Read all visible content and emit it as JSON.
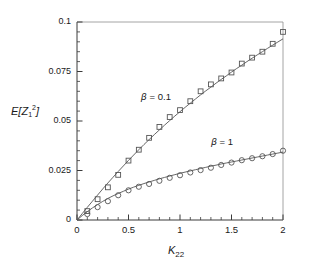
{
  "chart_data": {
    "type": "scatter",
    "title": "",
    "xlabel": "K22",
    "xlabel_base": "K",
    "xlabel_sub": "22",
    "ylabel": "E[Z_1^2]",
    "ylabel_prefix": "E[",
    "ylabel_var": "Z",
    "ylabel_sub": "1",
    "ylabel_sup": "2",
    "ylabel_suffix": "]",
    "xlim": [
      0,
      2
    ],
    "ylim": [
      0,
      0.1
    ],
    "grid": false,
    "legend_position": "inline-annotations",
    "xticks": [
      "0",
      "0.5",
      "1",
      "1.5",
      "2"
    ],
    "xtick_values": [
      0,
      0.5,
      1,
      1.5,
      2
    ],
    "x_minor_step": 0.1,
    "yticks": [
      "0",
      "0.025",
      "0.05",
      "0.075",
      "0.1"
    ],
    "ytick_values": [
      0,
      0.025,
      0.05,
      0.075,
      0.1
    ],
    "y_minor_step": 0.005,
    "annotations": [
      {
        "text_beta": "β",
        "text_rest": " = 0.1",
        "x": 0.62,
        "y": 0.0615
      },
      {
        "text_beta": "β",
        "text_rest": " = 1",
        "x": 1.3,
        "y": 0.039
      }
    ],
    "series": [
      {
        "name": "beta = 0.1",
        "marker": "square",
        "color": "#555555",
        "line_color": "#555555",
        "x": [
          0.05,
          0.1,
          0.15,
          0.2,
          0.25,
          0.3,
          0.35,
          0.4,
          0.45,
          0.5,
          0.55,
          0.6,
          0.65,
          0.7,
          0.75,
          0.8,
          0.85,
          0.9,
          0.95,
          1.0,
          1.05,
          1.1,
          1.15,
          1.2,
          1.25,
          1.3,
          1.35,
          1.4,
          1.45,
          1.5,
          1.55,
          1.6,
          1.65,
          1.7,
          1.75,
          1.8,
          1.85,
          1.9,
          1.95,
          2.0
        ],
        "y": [
          0.0028,
          0.0055,
          0.0082,
          0.0108,
          0.0133,
          0.0158,
          0.0182,
          0.0206,
          0.0229,
          0.0251,
          0.0273,
          0.0294,
          0.0315,
          0.0335,
          0.0355,
          0.0374,
          0.0393,
          0.0411,
          0.0429,
          0.0447,
          0.0464,
          0.0481,
          0.0497,
          0.0513,
          0.0529,
          0.0544,
          0.056,
          0.0575,
          0.0589,
          0.0604,
          0.0618,
          0.0632,
          0.0645,
          0.0659,
          0.0672,
          0.0685,
          0.0698,
          0.0711,
          0.0723,
          0.0735
        ],
        "points_x": [
          0.1,
          0.2,
          0.3,
          0.4,
          0.5,
          0.6,
          0.7,
          0.8,
          0.9,
          1.0,
          1.1,
          1.2,
          1.3,
          1.4,
          1.5,
          1.6,
          1.7,
          1.8,
          1.9,
          2.0
        ],
        "points_y": [
          0.0045,
          0.0105,
          0.0165,
          0.0228,
          0.03,
          0.0355,
          0.0415,
          0.047,
          0.052,
          0.0555,
          0.06,
          0.065,
          0.0685,
          0.0715,
          0.0745,
          0.079,
          0.082,
          0.085,
          0.089,
          0.095
        ],
        "curve_x": [
          0,
          0.05,
          0.1,
          0.15,
          0.2,
          0.25,
          0.3,
          0.35,
          0.4,
          0.45,
          0.5,
          0.55,
          0.6,
          0.65,
          0.7,
          0.75,
          0.8,
          0.85,
          0.9,
          0.95,
          1.0,
          1.05,
          1.1,
          1.15,
          1.2,
          1.25,
          1.3,
          1.35,
          1.4,
          1.45,
          1.5,
          1.55,
          1.6,
          1.65,
          1.7,
          1.75,
          1.8,
          1.85,
          1.9,
          1.95,
          2.0
        ],
        "curve_y": [
          0,
          0.0032,
          0.0064,
          0.0095,
          0.0126,
          0.0157,
          0.0187,
          0.0216,
          0.0245,
          0.0273,
          0.0301,
          0.0328,
          0.0355,
          0.0381,
          0.0406,
          0.0431,
          0.0455,
          0.0479,
          0.0502,
          0.0525,
          0.0547,
          0.0569,
          0.059,
          0.0611,
          0.0632,
          0.0652,
          0.0671,
          0.0691,
          0.071,
          0.0728,
          0.0747,
          0.0765,
          0.0782,
          0.08,
          0.0817,
          0.0834,
          0.085,
          0.0867,
          0.0883,
          0.0899,
          0.0915
        ]
      },
      {
        "name": "beta = 1",
        "marker": "circle",
        "color": "#555555",
        "line_color": "#555555",
        "points_x": [
          0.1,
          0.2,
          0.3,
          0.4,
          0.5,
          0.6,
          0.7,
          0.8,
          0.9,
          1.0,
          1.1,
          1.2,
          1.3,
          1.4,
          1.5,
          1.6,
          1.7,
          1.8,
          1.9,
          2.0
        ],
        "points_y": [
          0.003,
          0.0065,
          0.0095,
          0.0125,
          0.015,
          0.0168,
          0.0182,
          0.0198,
          0.0213,
          0.0226,
          0.024,
          0.0252,
          0.0264,
          0.0278,
          0.029,
          0.0302,
          0.0312,
          0.0322,
          0.0333,
          0.035
        ],
        "curve_x": [
          0,
          0.05,
          0.1,
          0.15,
          0.2,
          0.25,
          0.3,
          0.35,
          0.4,
          0.45,
          0.5,
          0.55,
          0.6,
          0.65,
          0.7,
          0.75,
          0.8,
          0.85,
          0.9,
          0.95,
          1.0,
          1.05,
          1.1,
          1.15,
          1.2,
          1.25,
          1.3,
          1.35,
          1.4,
          1.45,
          1.5,
          1.55,
          1.6,
          1.65,
          1.7,
          1.75,
          1.8,
          1.85,
          1.9,
          1.95,
          2.0
        ],
        "curve_y": [
          0,
          0.0022,
          0.0042,
          0.0061,
          0.0078,
          0.0094,
          0.0109,
          0.0122,
          0.0134,
          0.0145,
          0.0156,
          0.0166,
          0.0175,
          0.0184,
          0.0192,
          0.02,
          0.0208,
          0.0215,
          0.0222,
          0.0229,
          0.0236,
          0.0242,
          0.0248,
          0.0254,
          0.026,
          0.0266,
          0.0272,
          0.0277,
          0.0283,
          0.0288,
          0.0293,
          0.0298,
          0.0303,
          0.0308,
          0.0313,
          0.0318,
          0.0323,
          0.0328,
          0.0333,
          0.0338,
          0.0343
        ]
      }
    ]
  },
  "axes_geometry": {
    "left": 77,
    "right": 283,
    "top": 22,
    "bottom": 220
  }
}
